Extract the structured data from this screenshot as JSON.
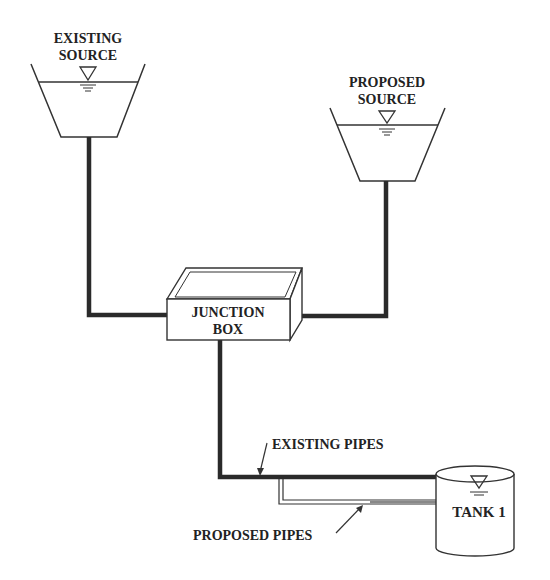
{
  "diagram": {
    "existing_source": {
      "line1": "EXISTING",
      "line2": "SOURCE"
    },
    "proposed_source": {
      "line1": "PROPOSED",
      "line2": "SOURCE"
    },
    "junction_box": {
      "line1": "JUNCTION",
      "line2": "BOX"
    },
    "tank": {
      "label": "TANK 1"
    },
    "existing_pipes_label": "EXISTING PIPES",
    "proposed_pipes_label": "PROPOSED PIPES",
    "colors": {
      "line": "#222222",
      "pipe": "#2a2a2a",
      "background": "#ffffff"
    }
  }
}
